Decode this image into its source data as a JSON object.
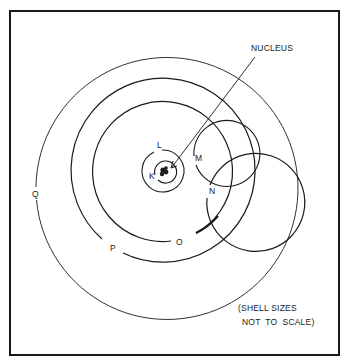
{
  "diagram": {
    "type": "atomic-shell-model",
    "center": [
      164,
      171
    ],
    "nucleus_label": "NUCLEUS",
    "note_line1": "(SHELL SIZES",
    "note_line2": "NOT  TO  SCALE)",
    "stroke_color": "#1a1a1a",
    "shells": [
      {
        "name": "K",
        "radius": 11,
        "label_pos": [
          150,
          172
        ]
      },
      {
        "name": "L",
        "radius": 21,
        "label_pos": [
          157,
          142
        ]
      },
      {
        "name": "M",
        "radius": 33,
        "label_pos": [
          196,
          155
        ]
      },
      {
        "name": "N",
        "radius": 49,
        "label_pos": [
          210,
          188
        ]
      },
      {
        "name": "O",
        "radius": 70,
        "label_pos": [
          176,
          240
        ]
      },
      {
        "name": "P",
        "radius": 92,
        "label_pos": [
          110,
          245
        ]
      },
      {
        "name": "Q",
        "radius": 131,
        "label_pos": [
          32,
          191
        ]
      }
    ]
  }
}
